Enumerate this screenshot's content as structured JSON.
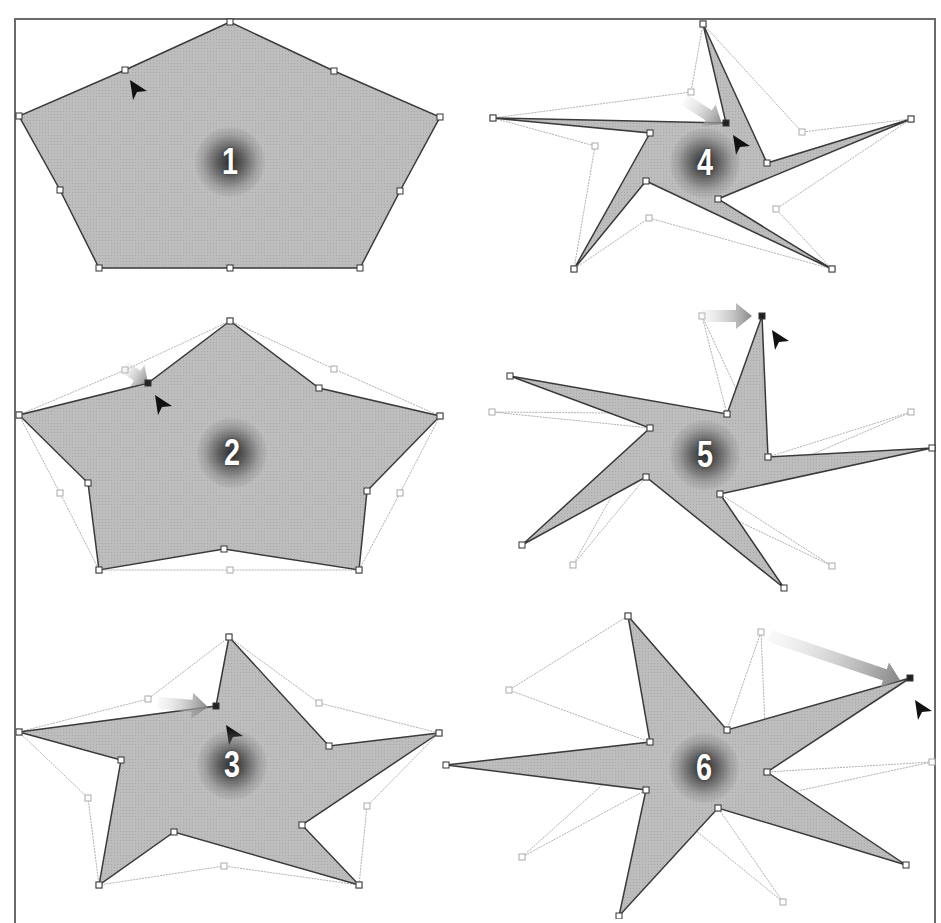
{
  "figure": {
    "title": "",
    "colors": {
      "fill": "#bdbdbd",
      "stroke": "#3a3a3a",
      "ghost_stroke": "#b0b0b0",
      "handle_fill": "#ffffff",
      "handle_stroke": "#333333",
      "ghost_handle": "#aaaaaa",
      "badge_text": "#ffffff",
      "frame": "#6a6a6a"
    }
  },
  "panels": [
    {
      "label": "1",
      "badge": {
        "x": 230,
        "y": 162
      },
      "shape": [
        [
          230,
          22
        ],
        [
          125,
          70
        ],
        [
          19,
          116
        ],
        [
          60,
          190
        ],
        [
          99,
          268
        ],
        [
          230,
          268
        ],
        [
          360,
          268
        ],
        [
          400,
          191
        ],
        [
          440,
          117
        ],
        [
          334,
          71
        ]
      ],
      "ghost": [],
      "cursor": {
        "x": 130,
        "y": 80
      },
      "arrow": null,
      "active_point": null
    },
    {
      "label": "4",
      "badge": {
        "x": 705,
        "y": 163
      },
      "shape": [
        [
          703,
          24
        ],
        [
          726,
          123
        ],
        [
          493,
          118
        ],
        [
          650,
          133
        ],
        [
          574,
          269
        ],
        [
          646,
          181
        ],
        [
          832,
          269
        ],
        [
          718,
          199
        ],
        [
          911,
          119
        ],
        [
          767,
          163
        ]
      ],
      "ghost": [
        [
          703,
          24
        ],
        [
          691,
          92
        ],
        [
          493,
          118
        ],
        [
          595,
          146
        ],
        [
          574,
          269
        ],
        [
          649,
          218
        ],
        [
          832,
          269
        ],
        [
          776,
          209
        ],
        [
          911,
          119
        ],
        [
          802,
          132
        ]
      ],
      "cursor": {
        "x": 733,
        "y": 135
      },
      "arrow": {
        "x1": 685,
        "y1": 100,
        "x2": 722,
        "y2": 124
      },
      "active_point": [
        726,
        123
      ]
    },
    {
      "label": "2",
      "badge": {
        "x": 232,
        "y": 453
      },
      "shape": [
        [
          230,
          321
        ],
        [
          148,
          383
        ],
        [
          19,
          415
        ],
        [
          88,
          483
        ],
        [
          99,
          570
        ],
        [
          224,
          549
        ],
        [
          359,
          570
        ],
        [
          367,
          491
        ],
        [
          440,
          416
        ],
        [
          319,
          388
        ]
      ],
      "ghost": [
        [
          230,
          321
        ],
        [
          125,
          370
        ],
        [
          19,
          415
        ],
        [
          60,
          493
        ],
        [
          99,
          570
        ],
        [
          230,
          570
        ],
        [
          359,
          570
        ],
        [
          400,
          493
        ],
        [
          440,
          416
        ],
        [
          334,
          369
        ]
      ],
      "cursor": {
        "x": 155,
        "y": 395
      },
      "arrow": {
        "x1": 124,
        "y1": 367,
        "x2": 148,
        "y2": 383
      },
      "active_point": [
        148,
        383
      ]
    },
    {
      "label": "5",
      "badge": {
        "x": 705,
        "y": 455
      },
      "shape": [
        [
          762,
          316
        ],
        [
          727,
          414
        ],
        [
          510,
          376
        ],
        [
          650,
          428
        ],
        [
          522,
          545
        ],
        [
          646,
          477
        ],
        [
          784,
          588
        ],
        [
          720,
          494
        ],
        [
          932,
          448
        ],
        [
          768,
          457
        ]
      ],
      "ghost": [
        [
          702,
          316
        ],
        [
          727,
          414
        ],
        [
          492,
          412
        ],
        [
          650,
          428
        ],
        [
          573,
          565
        ],
        [
          646,
          477
        ],
        [
          832,
          566
        ],
        [
          720,
          494
        ],
        [
          911,
          412
        ],
        [
          768,
          457
        ]
      ],
      "cursor": {
        "x": 772,
        "y": 330
      },
      "arrow": {
        "x1": 702,
        "y1": 316,
        "x2": 752,
        "y2": 316
      },
      "active_point": [
        762,
        316
      ]
    },
    {
      "label": "3",
      "badge": {
        "x": 232,
        "y": 765
      },
      "shape": [
        [
          229,
          637
        ],
        [
          216,
          706
        ],
        [
          19,
          732
        ],
        [
          121,
          760
        ],
        [
          99,
          885
        ],
        [
          174,
          832
        ],
        [
          359,
          885
        ],
        [
          302,
          825
        ],
        [
          439,
          733
        ],
        [
          329,
          746
        ]
      ],
      "ghost": [
        [
          229,
          637
        ],
        [
          148,
          699
        ],
        [
          19,
          732
        ],
        [
          88,
          798
        ],
        [
          99,
          885
        ],
        [
          224,
          866
        ],
        [
          359,
          885
        ],
        [
          367,
          806
        ],
        [
          439,
          733
        ],
        [
          319,
          703
        ]
      ],
      "cursor": {
        "x": 226,
        "y": 725
      },
      "arrow": {
        "x1": 158,
        "y1": 703,
        "x2": 208,
        "y2": 707
      },
      "active_point": [
        216,
        706
      ]
    },
    {
      "label": "6",
      "badge": {
        "x": 704,
        "y": 768
      },
      "shape": [
        [
          628,
          616
        ],
        [
          727,
          730
        ],
        [
          910,
          678
        ],
        [
          767,
          772
        ],
        [
          906,
          865
        ],
        [
          718,
          808
        ],
        [
          619,
          916
        ],
        [
          646,
          790
        ],
        [
          446,
          765
        ],
        [
          650,
          742
        ]
      ],
      "ghost": [
        [
          628,
          616
        ],
        [
          727,
          730
        ],
        [
          761,
          632
        ],
        [
          767,
          772
        ],
        [
          932,
          762
        ],
        [
          718,
          808
        ],
        [
          783,
          902
        ],
        [
          646,
          790
        ],
        [
          522,
          857
        ],
        [
          650,
          742
        ],
        [
          509,
          690
        ]
      ],
      "cursor": {
        "x": 915,
        "y": 700
      },
      "arrow": {
        "x1": 770,
        "y1": 636,
        "x2": 900,
        "y2": 680
      },
      "active_point": [
        910,
        678
      ]
    }
  ]
}
